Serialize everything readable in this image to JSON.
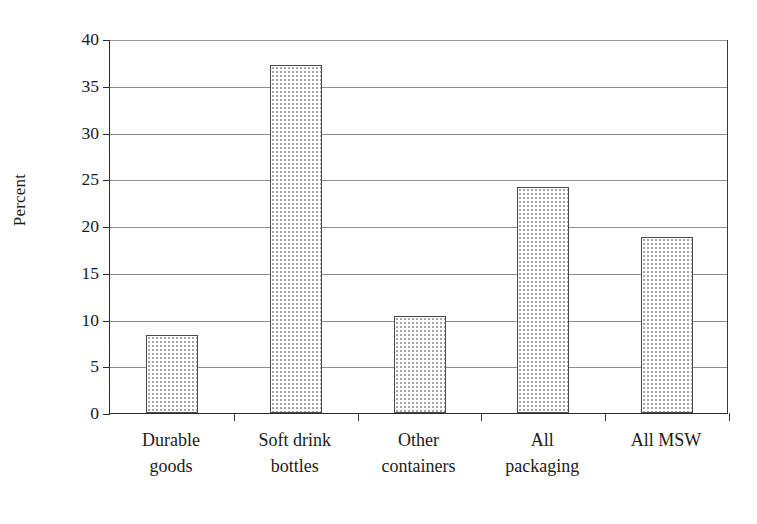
{
  "chart_data": {
    "type": "bar",
    "title": "",
    "subtitle": "",
    "xlabel": "",
    "ylabel": "Percent",
    "categories": [
      "Durable goods",
      "Soft drink bottles",
      "Other containers",
      "All packaging",
      "All MSW"
    ],
    "category_lines": [
      [
        "Durable",
        "goods"
      ],
      [
        "Soft drink",
        "bottles"
      ],
      [
        "Other",
        "containers"
      ],
      [
        "All",
        "packaging"
      ],
      [
        "All MSW",
        ""
      ]
    ],
    "values": [
      8.3,
      37.2,
      10.4,
      24.2,
      18.8
    ],
    "ylim": [
      0,
      40
    ],
    "y_ticks": [
      0,
      5,
      10,
      15,
      20,
      25,
      30,
      35,
      40
    ],
    "y_tick_labels": [
      "0",
      "5",
      "10",
      "15",
      "20",
      "25",
      "30",
      "35",
      "40"
    ],
    "grid": true,
    "grid_axis": "y",
    "legend": false,
    "legend_position": "none",
    "bar_fill": "#fdfdfd",
    "bar_pattern": "fine-dotted-stipple",
    "bar_edge_color": "#4a4a4a",
    "background": "#ffffff",
    "axis_color": "#2b2b2b",
    "grid_color": "#8d8d8d"
  },
  "axis": {
    "y_title": "Percent"
  }
}
